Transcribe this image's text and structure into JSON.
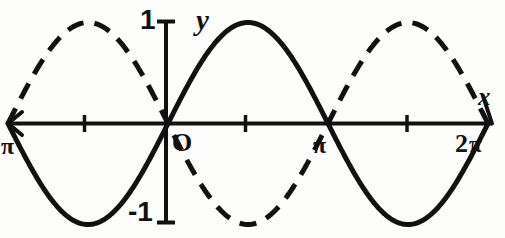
{
  "figure": {
    "background_color": "#fdfdfb",
    "ink_color": "#111111"
  },
  "labels": {
    "y_axis_name": "y",
    "x_axis_name": "x",
    "y_max_tick": "1",
    "y_min_tick": "-1",
    "origin": "O",
    "x_left_tick": "π",
    "x_mid_tick": "π",
    "x_right_tick_number": "2",
    "x_right_tick_pi": "π"
  },
  "icons": {
    "x_axis_arrow": "arrow-right-icon",
    "x_axis_arrow_left": "arrow-left-icon"
  },
  "chart_data": {
    "type": "line",
    "title": "",
    "xlabel": "x",
    "ylabel": "y",
    "xlim": [
      -3.141592653589793,
      6.283185307179586
    ],
    "ylim": [
      -1,
      1
    ],
    "grid": false,
    "legend": "none",
    "x_tick_labels": [
      "π",
      "O",
      "π",
      "2π"
    ],
    "x_tick_values": [
      -3.141592653589793,
      0,
      3.141592653589793,
      6.283185307179586
    ],
    "x_minor_tick_values": [
      -1.5707963267948966,
      1.5707963267948966,
      4.71238898038469
    ],
    "y_tick_labels": [
      "1",
      "-1"
    ],
    "y_tick_values": [
      1,
      -1
    ],
    "series": [
      {
        "name": "sin(x)",
        "style": "solid",
        "color": "#111111",
        "x": [
          -3.141592653589793,
          -2.748893571891069,
          -2.356194490192345,
          -1.9634954084936207,
          -1.5707963267948966,
          -1.1780972450961724,
          -0.7853981633974483,
          -0.39269908169872414,
          0,
          0.39269908169872414,
          0.7853981633974483,
          1.1780972450961724,
          1.5707963267948966,
          1.9634954084936207,
          2.356194490192345,
          2.748893571891069,
          3.141592653589793,
          3.5342917352885173,
          3.9269908169872414,
          4.319689898685965,
          4.71238898038469,
          5.105088062083414,
          5.497787143782138,
          5.890486225480862,
          6.283185307179586
        ],
        "y": [
          0,
          -0.3827,
          -0.7071,
          -0.9239,
          -1,
          -0.9239,
          -0.7071,
          -0.3827,
          0,
          0.3827,
          0.7071,
          0.9239,
          1,
          0.9239,
          0.7071,
          0.3827,
          0,
          -0.3827,
          -0.7071,
          -0.9239,
          -1,
          -0.9239,
          -0.7071,
          -0.3827,
          0
        ]
      },
      {
        "name": "-sin(x)",
        "style": "dashed",
        "color": "#111111",
        "x": [
          -3.141592653589793,
          -2.748893571891069,
          -2.356194490192345,
          -1.9634954084936207,
          -1.5707963267948966,
          -1.1780972450961724,
          -0.7853981633974483,
          -0.39269908169872414,
          0,
          0.39269908169872414,
          0.7853981633974483,
          1.1780972450961724,
          1.5707963267948966,
          1.9634954084936207,
          2.356194490192345,
          2.748893571891069,
          3.141592653589793,
          3.5342917352885173,
          3.9269908169872414,
          4.319689898685965,
          4.71238898038469,
          5.105088062083414,
          5.497787143782138,
          5.890486225480862,
          6.283185307179586
        ],
        "y": [
          0,
          0.3827,
          0.7071,
          0.9239,
          1,
          0.9239,
          0.7071,
          0.3827,
          0,
          -0.3827,
          -0.7071,
          -0.9239,
          -1,
          -0.9239,
          -0.7071,
          -0.3827,
          0,
          0.3827,
          0.7071,
          0.9239,
          1,
          0.9239,
          0.7071,
          0.3827,
          0
        ]
      }
    ]
  }
}
